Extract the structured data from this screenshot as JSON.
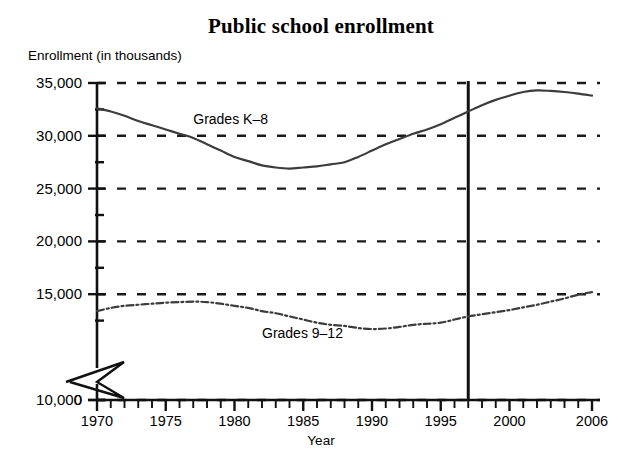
{
  "chart_data": {
    "type": "line",
    "title": "Public school enrollment",
    "ylabel": "Enrollment (in thousands)",
    "xlabel": "Year",
    "grid": "horizontal-dashed",
    "legend": "inline-annotations",
    "xlim": [
      1970,
      2006
    ],
    "ylim": [
      0,
      35000
    ],
    "y_axis_break": true,
    "y_axis_break_between": [
      0,
      10000
    ],
    "yticks": [
      0,
      10000,
      15000,
      20000,
      25000,
      30000,
      35000
    ],
    "ytick_labels": [
      "0",
      "10,000",
      "15,000",
      "20,000",
      "25,000",
      "30,000",
      "35,000"
    ],
    "y_minor_ticks": [
      12500,
      17500,
      22500,
      27500,
      32500
    ],
    "xticks": [
      1970,
      1975,
      1980,
      1985,
      1990,
      1995,
      2000,
      2006
    ],
    "xtick_labels": [
      "1970",
      "1975",
      "1980",
      "1985",
      "1990",
      "1995",
      "2000",
      "2006"
    ],
    "x_minor_tick_interval": 1,
    "projection_divider_year": 1997,
    "x": [
      1970,
      1971,
      1972,
      1973,
      1974,
      1975,
      1976,
      1977,
      1978,
      1979,
      1980,
      1981,
      1982,
      1983,
      1984,
      1985,
      1986,
      1987,
      1988,
      1989,
      1990,
      1991,
      1992,
      1993,
      1994,
      1995,
      1996,
      1997,
      1998,
      1999,
      2000,
      2001,
      2002,
      2003,
      2004,
      2005,
      2006
    ],
    "series": [
      {
        "name": "Grades K-8",
        "label": "Grades K–8",
        "linestyle": "solid",
        "color": "#3c3c3c",
        "values": [
          32600,
          32300,
          31900,
          31400,
          31000,
          30600,
          30200,
          29800,
          29200,
          28600,
          28000,
          27600,
          27200,
          27000,
          26900,
          27000,
          27100,
          27300,
          27500,
          28000,
          28600,
          29200,
          29700,
          30200,
          30600,
          31100,
          31700,
          32300,
          32900,
          33400,
          33800,
          34150,
          34300,
          34250,
          34150,
          34000,
          33800
        ]
      },
      {
        "name": "Grades 9-12",
        "label": "Grades 9–12",
        "linestyle": "dashdot",
        "color": "#3c3c3c",
        "values": [
          13400,
          13700,
          13900,
          14000,
          14100,
          14200,
          14250,
          14300,
          14250,
          14100,
          13900,
          13700,
          13400,
          13200,
          12900,
          12600,
          12300,
          12100,
          12000,
          11800,
          11700,
          11750,
          11900,
          12100,
          12200,
          12300,
          12600,
          12900,
          13100,
          13300,
          13500,
          13750,
          14000,
          14300,
          14600,
          14950,
          15200
        ]
      }
    ],
    "annotations": [
      {
        "text": "Grades K–8",
        "year": 1977,
        "value": 31600
      },
      {
        "text": "Grades 9–12",
        "year": 1982,
        "value": 11300
      }
    ]
  }
}
